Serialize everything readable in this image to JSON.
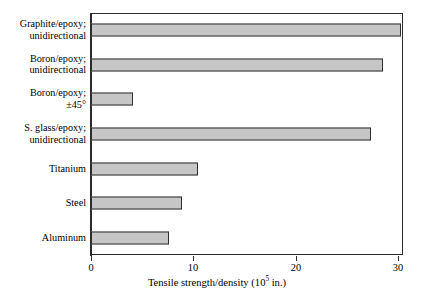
{
  "chart_data": {
    "type": "bar",
    "orientation": "horizontal",
    "title": "",
    "xlabel": "Tensile strength/density (10^5 in.)",
    "xlabel_prefix": "Tensile strength/density (10",
    "xlabel_exponent": "5",
    "xlabel_suffix": " in.)",
    "ylabel": "",
    "categories": [
      "Graphite/epoxy; unidirectional",
      "Boron/epoxy; unidirectional",
      "Boron/epoxy; ±45°",
      "S. glass/epoxy; unidirectional",
      "Titanium",
      "Steel",
      "Aluminum"
    ],
    "category_lines": [
      [
        "Graphite/epoxy;",
        "unidirectional"
      ],
      [
        "Boron/epoxy;",
        "unidirectional"
      ],
      [
        "Boron/epoxy;",
        "±45°"
      ],
      [
        "S. glass/epoxy;",
        "unidirectional"
      ],
      [
        "Titanium",
        ""
      ],
      [
        "Steel",
        ""
      ],
      [
        "Aluminum",
        ""
      ]
    ],
    "values": [
      30.3,
      28.5,
      4.1,
      27.4,
      10.5,
      8.9,
      7.6
    ],
    "xlim": [
      0,
      30.5
    ],
    "xticks": [
      0,
      10,
      20,
      30
    ],
    "xtick_labels": [
      "0",
      "10",
      "20",
      "30"
    ],
    "grid": false,
    "legend": false,
    "bar_fill": "#c6c6c6",
    "bar_edge": "#2e2e2e",
    "frame_color": "#2b2b2b",
    "background": "#ffffff"
  }
}
